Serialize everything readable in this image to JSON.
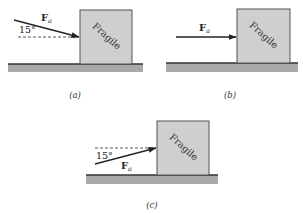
{
  "figure": {
    "panels": [
      {
        "id": "a",
        "caption": "(a)",
        "box_label": "Fragile",
        "force_label": "F",
        "force_subscript": "a",
        "angle_label": "15°",
        "force_direction": "downward at 15° below horizontal"
      },
      {
        "id": "b",
        "caption": "(b)",
        "box_label": "Fragile",
        "force_label": "F",
        "force_subscript": "a",
        "force_direction": "horizontal"
      },
      {
        "id": "c",
        "caption": "(c)",
        "box_label": "Fragile",
        "force_label": "F",
        "force_subscript": "a",
        "angle_label": "15°",
        "force_direction": "upward at 15° above horizontal"
      }
    ],
    "colors": {
      "box": "#cfcfcf",
      "ground": "#a9a9a9",
      "ink": "#222222"
    }
  }
}
